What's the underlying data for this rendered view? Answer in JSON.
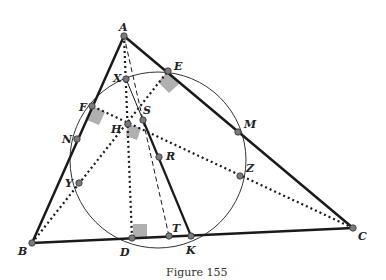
{
  "caption": "Figure 155",
  "points": {
    "A": {
      "x": 124,
      "y": 36,
      "lx": 119,
      "ly": 31
    },
    "B": {
      "x": 32,
      "y": 243,
      "lx": 18,
      "ly": 255
    },
    "C": {
      "x": 353,
      "y": 228,
      "lx": 358,
      "ly": 240
    },
    "D": {
      "x": 132,
      "y": 238,
      "lx": 120,
      "ly": 256
    },
    "K": {
      "x": 191,
      "y": 236,
      "lx": 186,
      "ly": 254
    },
    "T": {
      "x": 169,
      "y": 236,
      "lx": 172,
      "ly": 232
    },
    "E": {
      "x": 168,
      "y": 71,
      "lx": 174,
      "ly": 70
    },
    "F": {
      "x": 92,
      "y": 106,
      "lx": 79,
      "ly": 111
    },
    "N": {
      "x": 77,
      "y": 139,
      "lx": 62,
      "ly": 143
    },
    "Y": {
      "x": 79,
      "y": 183,
      "lx": 65,
      "ly": 187
    },
    "X": {
      "x": 126,
      "y": 79,
      "lx": 113,
      "ly": 82
    },
    "S": {
      "x": 143,
      "y": 120,
      "lx": 143,
      "ly": 114
    },
    "H": {
      "x": 128,
      "y": 124,
      "lx": 111,
      "ly": 133
    },
    "R": {
      "x": 159,
      "y": 157,
      "lx": 166,
      "ly": 160
    },
    "M": {
      "x": 238,
      "y": 132,
      "lx": 244,
      "ly": 128
    },
    "Z": {
      "x": 240,
      "y": 176,
      "lx": 246,
      "ly": 172
    }
  },
  "labels": {
    "A": "A",
    "B": "B",
    "C": "C",
    "D": "D",
    "K": "K",
    "T": "T",
    "E": "E",
    "F": "F",
    "N": "N",
    "Y": "Y",
    "X": "X",
    "S": "S",
    "H": "H",
    "R": "R",
    "M": "M",
    "Z": "Z"
  },
  "colors": {
    "line": "#1a1a1a",
    "point_fill": "#7a7a7a",
    "right_angle": "#b0b0b0"
  }
}
